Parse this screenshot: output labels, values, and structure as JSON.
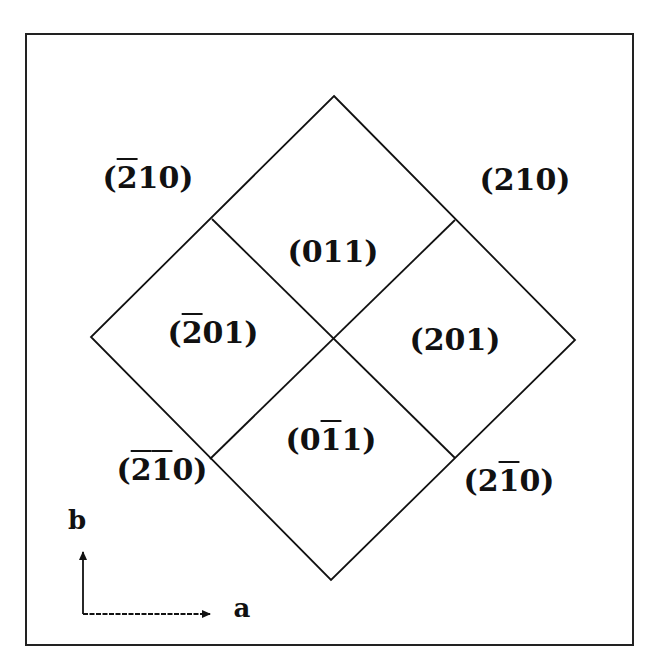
{
  "diagram": {
    "type": "crystal-face-diagram",
    "frame": {
      "x": 26,
      "y": 34,
      "width": 607,
      "height": 611
    },
    "diamond": {
      "top": [
        334,
        96
      ],
      "right": [
        575,
        340
      ],
      "bottom": [
        331,
        580
      ],
      "left": [
        91,
        337
      ],
      "center": [
        333,
        340
      ],
      "edge_midpoints": {
        "upper_left": [
          212,
          219
        ],
        "upper_right": [
          455,
          220
        ],
        "lower_left": [
          210,
          459
        ],
        "lower_right": [
          455,
          458
        ]
      }
    },
    "faces_inside": [
      {
        "id": "011",
        "parts": [
          {
            "t": "(0"
          },
          {
            "t": "1"
          },
          {
            "t": "1)"
          }
        ],
        "bars": [],
        "x": 333,
        "y": 252
      },
      {
        "id": "-201",
        "parts": [
          {
            "t": "("
          },
          {
            "t": "2",
            "bar": true
          },
          {
            "t": "01)"
          }
        ],
        "x": 213,
        "y": 333
      },
      {
        "id": "201",
        "parts": [
          {
            "t": "(201)"
          }
        ],
        "x": 455,
        "y": 340
      },
      {
        "id": "0-11",
        "parts": [
          {
            "t": "(0"
          },
          {
            "t": "1",
            "bar": true
          },
          {
            "t": "1)"
          }
        ],
        "x": 331,
        "y": 440
      }
    ],
    "faces_outside": [
      {
        "id": "-210",
        "parts": [
          {
            "t": "("
          },
          {
            "t": "2",
            "bar": true
          },
          {
            "t": "10)"
          }
        ],
        "x": 148,
        "y": 178
      },
      {
        "id": "210",
        "parts": [
          {
            "t": "(210)"
          }
        ],
        "x": 525,
        "y": 180
      },
      {
        "id": "-2-10",
        "parts": [
          {
            "t": "("
          },
          {
            "t": "2",
            "bar": true
          },
          {
            "t": "1",
            "bar": true
          },
          {
            "t": "0)"
          }
        ],
        "x": 162,
        "y": 470
      },
      {
        "id": "2-10",
        "parts": [
          {
            "t": "(2"
          },
          {
            "t": "1",
            "bar": true
          },
          {
            "t": "0)"
          }
        ],
        "x": 509,
        "y": 481
      }
    ],
    "axes": {
      "origin": [
        83,
        614
      ],
      "b": {
        "label": "b",
        "tip": [
          83,
          552
        ],
        "label_pos": [
          77,
          520
        ]
      },
      "a": {
        "label": "a",
        "tip": [
          210,
          614
        ],
        "label_pos": [
          242,
          608
        ]
      }
    },
    "colors": {
      "line": "#111111",
      "background": "#ffffff"
    }
  }
}
